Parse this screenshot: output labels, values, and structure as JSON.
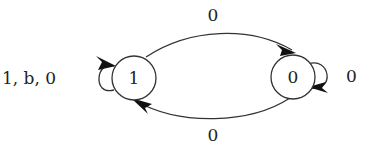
{
  "diagram": {
    "type": "state-machine",
    "states": [
      {
        "id": "s1",
        "label": "1"
      },
      {
        "id": "s0",
        "label": "0"
      }
    ],
    "transitions": [
      {
        "from": "s1",
        "to": "s1",
        "label": "1, b, 0"
      },
      {
        "from": "s1",
        "to": "s0",
        "label": "0"
      },
      {
        "from": "s0",
        "to": "s1",
        "label": "0"
      },
      {
        "from": "s0",
        "to": "s0",
        "label": "0"
      }
    ]
  }
}
